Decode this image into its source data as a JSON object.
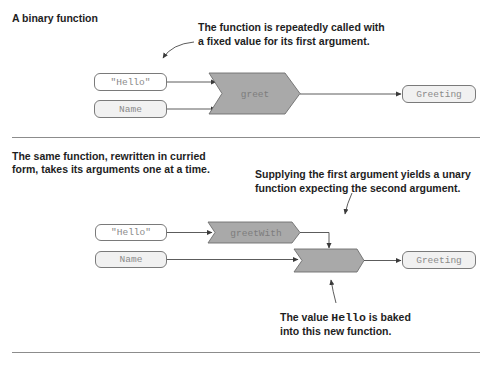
{
  "top": {
    "title": "A binary function",
    "annotation_line1": "The function is repeatedly called with",
    "annotation_line2": "a fixed value for its first argument.",
    "inputs": [
      {
        "label": "\"Hello\""
      },
      {
        "label": "Name"
      }
    ],
    "function": {
      "label": "greet"
    },
    "output": {
      "label": "Greeting"
    }
  },
  "bottom": {
    "title_line1": "The same function, rewritten in curried",
    "title_line2": "form, takes its arguments one at a time.",
    "annotation_top_line1": "Supplying the first argument yields a unary",
    "annotation_top_line2": "function expecting the second argument.",
    "inputs": [
      {
        "label": "\"Hello\""
      },
      {
        "label": "Name"
      }
    ],
    "curried_function": {
      "label": "greetWith"
    },
    "unary_function": {
      "label": ""
    },
    "output": {
      "label": "Greeting"
    },
    "annotation_bottom_prefix": "The value ",
    "annotation_bottom_code": "Hello",
    "annotation_bottom_suffix": " is baked",
    "annotation_bottom_line2": "into this new function."
  },
  "colors": {
    "chevron_fill": "#a9a9a9",
    "chevron_stroke": "#6e6e6e",
    "line": "#4a4a4a",
    "divider": "#8c8c8c"
  }
}
